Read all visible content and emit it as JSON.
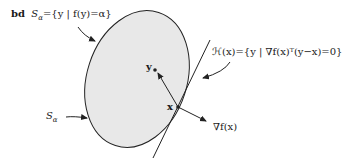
{
  "figure": {
    "tag": "bd",
    "set_def_lhs": "S",
    "set_def_sub": "α",
    "set_def_rhs": "={y | f(y)=α}",
    "hyperplane_label": "ℋ(x)={y | ∇f(x)ᵀ(y−x)=0}",
    "set_label": "S",
    "set_label_sub": "α",
    "point_y": "y",
    "point_x": "x",
    "gradient_label": "∇f(x)"
  },
  "colors": {
    "region_fill": "#e8e8e8",
    "stroke": "#222222"
  }
}
